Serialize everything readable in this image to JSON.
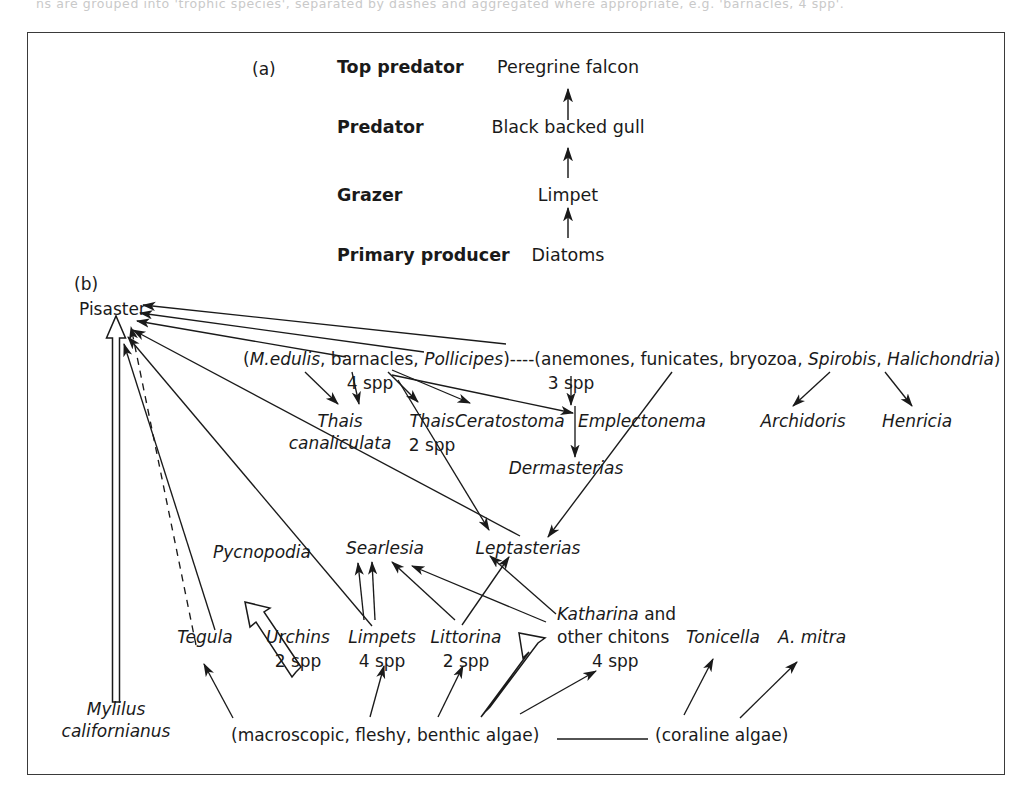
{
  "figure": {
    "cut_text": "ns are grouped into 'trophic species', separated by dashes and aggregated where appropriate, e.g. 'barnacles, 4 spp'.",
    "panel_a_tag": "(a)",
    "panel_b_tag": "(b)"
  },
  "panel_a": {
    "levels": [
      {
        "role": "Top predator",
        "organism": "Peregrine falcon"
      },
      {
        "role": "Predator",
        "organism": "Black backed gull"
      },
      {
        "role": "Grazer",
        "organism": "Limpet"
      },
      {
        "role": "Primary producer",
        "organism": "Diatoms"
      }
    ]
  },
  "panel_b": {
    "nodes": {
      "pisaster": "Pisaster",
      "mytilus_l1": "Mylilus",
      "mytilus_l2": "californianus",
      "group_mussel_pre": "(",
      "group_mussel_a": "M.edulis",
      "group_mussel_b": ", barnacles, ",
      "group_mussel_c": "Pollicipes",
      "group_mussel_post": ")",
      "group_mussel_spp": "4 spp",
      "dashes": "----",
      "group_anem_pre": "(anemones, funicates, bryozoa, ",
      "group_anem_a": "Spirobis",
      "group_anem_mid": ", ",
      "group_anem_b": "Halichondria",
      "group_anem_post": ")",
      "group_anem_spp": "3 spp",
      "thais_c_l1": "Thais",
      "thais_c_l2": "canaliculata",
      "thais2_l1": "Thais",
      "thais2_l2": "2 spp",
      "ceratostoma": "Ceratostoma",
      "emplectonema": "Emplectonema",
      "dermasterias": "Dermasterias",
      "archidoris": "Archidoris",
      "henricia": "Henricia",
      "leptasterias": "Leptasterias",
      "searlesia": "Searlesia",
      "pycnopodia": "Pycnopodia",
      "tegula": "Tegula",
      "urchins_l1": "Urchins",
      "urchins_l2": "2 spp",
      "limpets_l1": "Limpets",
      "limpets_l2": "4 spp",
      "littorina_l1": "Littorina",
      "littorina_l2": "2 spp",
      "katharina_l1a": "Katharina",
      "katharina_l1b": " and",
      "katharina_l2": "other chitons",
      "katharina_l3": "4 spp",
      "tonicella": "Tonicella",
      "amitra": "A. mitra",
      "benthic_algae": "(macroscopic, fleshy, benthic algae)",
      "coraline_algae": "(coraline algae)"
    }
  },
  "colors": {
    "ink": "#1a1a1a",
    "frame": "#3a3a3a",
    "paper": "#ffffff"
  }
}
